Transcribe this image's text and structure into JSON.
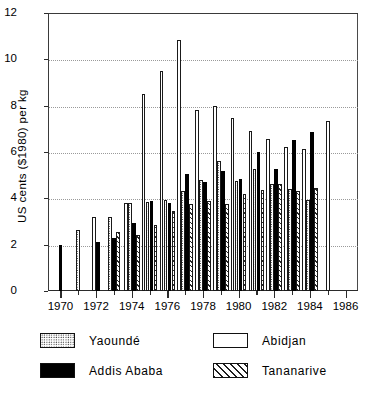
{
  "chart_data": {
    "type": "bar",
    "title": "",
    "subtitle": "",
    "xlabel": "",
    "ylabel": "US cents ($1980) per kg",
    "ylim": [
      0,
      12
    ],
    "ytick_values": [
      0,
      2,
      4,
      6,
      8,
      10,
      12
    ],
    "ytick_labels": [
      "0",
      "2",
      "4",
      "6",
      "8",
      "10",
      "12"
    ],
    "grid": "horizontal-dotted",
    "legend_position": "below-plot",
    "xlim": [
      1969.3,
      1986.7
    ],
    "x": [
      1970,
      1971,
      1972,
      1973,
      1974,
      1975,
      1976,
      1977,
      1978,
      1979,
      1980,
      1981,
      1982,
      1983,
      1984,
      1985,
      1986
    ],
    "xtick_labels": [
      "1970",
      "1972",
      "1974",
      "1976",
      "1978",
      "1980",
      "1982",
      "1984",
      "1986"
    ],
    "xtick_minor_labels": [
      "1971",
      "1973",
      "1975",
      "1977",
      "1979",
      "1981",
      "1983",
      "1985"
    ],
    "series": [
      {
        "name": "Yaoundé",
        "color": "#ffffff",
        "pattern": "dotted",
        "values": [
          null,
          2.65,
          null,
          3.2,
          3.8,
          3.85,
          3.95,
          4.3,
          4.8,
          5.6,
          4.75,
          5.25,
          4.6,
          4.4,
          3.95,
          null,
          null
        ]
      },
      {
        "name": "Abidjan",
        "color": "#ffffff",
        "pattern": "open",
        "values": [
          null,
          null,
          3.2,
          null,
          3.8,
          8.5,
          9.5,
          10.85,
          7.8,
          8.0,
          7.45,
          6.9,
          6.55,
          6.2,
          6.15,
          7.35,
          null
        ]
      },
      {
        "name": "Addis Ababa",
        "color": "#000000",
        "pattern": "solid",
        "values": [
          2.0,
          null,
          2.1,
          2.3,
          2.95,
          3.9,
          3.8,
          5.05,
          4.7,
          5.2,
          4.85,
          6.0,
          5.25,
          6.5,
          6.85,
          null,
          null
        ]
      },
      {
        "name": "Tananarive",
        "color": "#ffffff",
        "pattern": "diagonal-hatch",
        "values": [
          null,
          null,
          null,
          2.55,
          2.4,
          2.85,
          3.45,
          3.75,
          3.9,
          3.75,
          4.2,
          4.35,
          4.6,
          4.3,
          4.45,
          null,
          null
        ]
      }
    ]
  },
  "legend": {
    "entries": [
      {
        "label": "Yaoundé",
        "pattern": "dotted"
      },
      {
        "label": "Abidjan",
        "pattern": "open"
      },
      {
        "label": "Addis Ababa",
        "pattern": "solid"
      },
      {
        "label": "Tananarive",
        "pattern": "diagonal-hatch"
      }
    ]
  }
}
